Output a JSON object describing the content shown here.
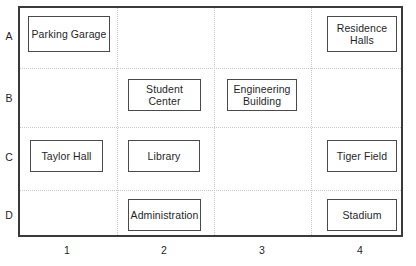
{
  "figure": {
    "type": "campus-grid-map",
    "width": 416,
    "height": 266,
    "frame_color": "#3a3a3a",
    "grid_color": "#c8c8c8",
    "box_border_color": "#4a4a4a",
    "background": "#ffffff"
  },
  "axes": {
    "x_ticks": [
      {
        "label": "1",
        "x": 67
      },
      {
        "label": "2",
        "x": 164
      },
      {
        "label": "3",
        "x": 262
      },
      {
        "label": "4",
        "x": 360
      }
    ],
    "y_ticks": [
      {
        "label": "A",
        "y": 30
      },
      {
        "label": "B",
        "y": 92
      },
      {
        "label": "C",
        "y": 151
      },
      {
        "label": "D",
        "y": 209
      }
    ],
    "grid_lines_h": [
      60,
      119,
      182
    ],
    "grid_lines_v": [
      97,
      194,
      291
    ]
  },
  "buildings": [
    {
      "name": "Parking Garage",
      "label": "Parking Garage",
      "row": "A",
      "col": 1,
      "x": 28,
      "y": 16,
      "w": 82,
      "h": 36
    },
    {
      "name": "Residence Halls",
      "label": "Residence\nHalls",
      "row": "A",
      "col": 4,
      "x": 327,
      "y": 16,
      "w": 70,
      "h": 36
    },
    {
      "name": "Student Center",
      "label": "Student\nCenter",
      "row": "B",
      "col": 2,
      "x": 128,
      "y": 79,
      "w": 73,
      "h": 32
    },
    {
      "name": "Engineering Building",
      "label": "Engineering\nBuilding",
      "row": "B",
      "col": 3,
      "x": 227,
      "y": 79,
      "w": 70,
      "h": 32
    },
    {
      "name": "Taylor Hall",
      "label": "Taylor Hall",
      "row": "C",
      "col": 1,
      "x": 30,
      "y": 140,
      "w": 73,
      "h": 32
    },
    {
      "name": "Library",
      "label": "Library",
      "row": "C",
      "col": 2,
      "x": 128,
      "y": 140,
      "w": 72,
      "h": 32
    },
    {
      "name": "Tiger Field",
      "label": "Tiger Field",
      "row": "C",
      "col": 4,
      "x": 327,
      "y": 140,
      "w": 70,
      "h": 32
    },
    {
      "name": "Administration",
      "label": "Administration",
      "row": "D",
      "col": 2,
      "x": 128,
      "y": 199,
      "w": 73,
      "h": 32
    },
    {
      "name": "Stadium",
      "label": "Stadium",
      "row": "D",
      "col": 4,
      "x": 327,
      "y": 199,
      "w": 70,
      "h": 32
    }
  ]
}
